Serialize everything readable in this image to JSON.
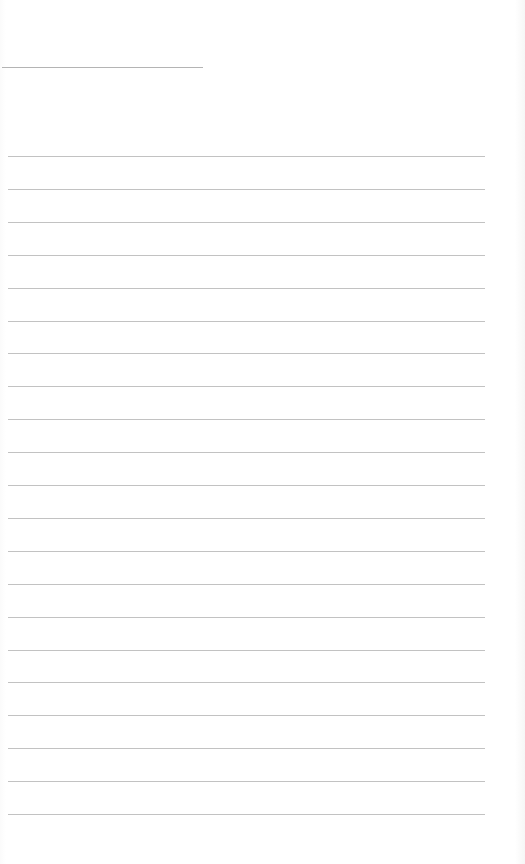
{
  "document": {
    "type": "blank lined sheet",
    "title_line": {
      "x": 2,
      "y": 67,
      "width": 201
    },
    "rules": {
      "count": 21,
      "x": 8,
      "width": 477,
      "first_y": 156,
      "last_y": 814,
      "color": "#c2c2c2"
    }
  }
}
